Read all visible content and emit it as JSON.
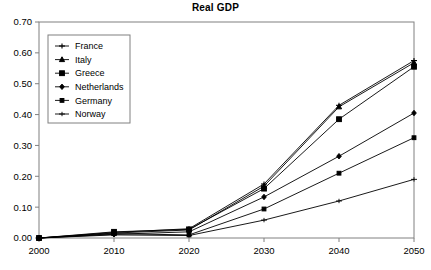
{
  "chart_data": {
    "type": "line",
    "title": "Real GDP",
    "xlabel": "",
    "ylabel": "",
    "x": [
      2000,
      2010,
      2020,
      2030,
      2040,
      2050
    ],
    "categories": [
      "2000",
      "2010",
      "2020",
      "2030",
      "2040",
      "2050"
    ],
    "xlim": [
      2000,
      2050
    ],
    "ylim": [
      0.0,
      0.7
    ],
    "ytick_labels": [
      "0.70",
      "0.60",
      "0.50",
      "0.40",
      "0.30",
      "0.20",
      "0.10",
      "0.00"
    ],
    "ytick_values": [
      0.7,
      0.6,
      0.5,
      0.4,
      0.3,
      0.2,
      0.1,
      0.0
    ],
    "xtick_labels": [
      "2000",
      "2010",
      "2020",
      "2030",
      "2040",
      "2050"
    ],
    "grid": false,
    "legend_position": "upper-left",
    "series": [
      {
        "name": "France",
        "marker": "cross",
        "values": [
          0.0,
          0.018,
          0.03,
          0.175,
          0.43,
          0.575
        ]
      },
      {
        "name": "Italy",
        "marker": "triangle",
        "values": [
          0.0,
          0.016,
          0.026,
          0.168,
          0.425,
          0.568
        ]
      },
      {
        "name": "Greece",
        "marker": "square",
        "values": [
          0.0,
          0.02,
          0.028,
          0.16,
          0.385,
          0.555
        ]
      },
      {
        "name": "Netherlands",
        "marker": "diamond",
        "values": [
          0.0,
          0.012,
          0.02,
          0.133,
          0.265,
          0.405
        ]
      },
      {
        "name": "Germany",
        "marker": "square-small",
        "values": [
          0.0,
          0.014,
          0.01,
          0.094,
          0.21,
          0.325
        ]
      },
      {
        "name": "Norway",
        "marker": "plus",
        "values": [
          0.0,
          0.01,
          0.008,
          0.058,
          0.12,
          0.19
        ]
      }
    ]
  },
  "legend": {
    "entries": [
      {
        "label": "France"
      },
      {
        "label": "Italy"
      },
      {
        "label": "Greece"
      },
      {
        "label": "Netherlands"
      },
      {
        "label": "Germany"
      },
      {
        "label": "Norway"
      }
    ]
  },
  "colors": {
    "line": "#000000",
    "axis": "#808080",
    "background": "#ffffff",
    "text": "#000000"
  }
}
